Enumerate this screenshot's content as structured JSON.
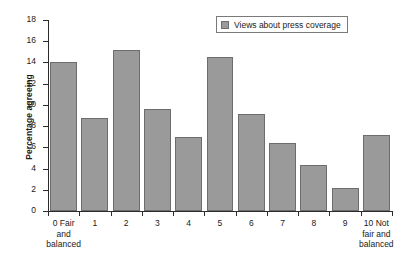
{
  "chart_data": {
    "type": "bar",
    "title": "",
    "xlabel": "",
    "ylabel": "Percentage agreeing",
    "ylim": [
      0,
      18
    ],
    "y_ticks": [
      0,
      2,
      4,
      6,
      8,
      10,
      12,
      14,
      16,
      18
    ],
    "grid": false,
    "legend_position": "top-right",
    "legend": [
      "Views about press coverage"
    ],
    "categories": [
      "0 Fair\nand\nbalanced",
      "1",
      "2",
      "3",
      "4",
      "5",
      "6",
      "7",
      "8",
      "9",
      "10 Not\nfair and\nbalanced"
    ],
    "category_values": [
      0,
      1,
      2,
      3,
      4,
      5,
      6,
      7,
      8,
      9,
      10
    ],
    "series": [
      {
        "name": "Views about press coverage",
        "values": [
          14.0,
          8.8,
          15.2,
          9.6,
          7.0,
          14.5,
          9.1,
          6.4,
          4.3,
          2.2,
          7.2
        ]
      }
    ]
  },
  "colors": {
    "bar_fill": "#9a9a9a",
    "bar_border": "#6d6d6d",
    "axis": "#2b2b2b",
    "background": "#ffffff",
    "text": "#1a1a1a"
  },
  "legend": {
    "label": "Views about press coverage",
    "swatch_icon": "square-swatch-icon"
  },
  "axes": {
    "y_title": "Percentage agreeing"
  }
}
